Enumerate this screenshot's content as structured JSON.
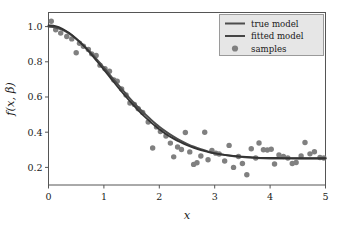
{
  "chart_data": {
    "type": "line",
    "title": "",
    "xlabel": "x",
    "ylabel": "f(x, β)",
    "xlim": [
      0,
      5
    ],
    "ylim": [
      0.1,
      1.08
    ],
    "xticks": [
      0,
      1,
      2,
      3,
      4,
      5
    ],
    "xticklabels": [
      "0",
      "1",
      "2",
      "3",
      "4",
      "5"
    ],
    "yticks": [
      0.2,
      0.4,
      0.6,
      0.8,
      1.0
    ],
    "yticklabels": [
      "0.2",
      "0.4",
      "0.6",
      "0.8",
      "1.0"
    ],
    "grid": false,
    "legend_position": "upper right",
    "legend": [
      {
        "label": "true model",
        "type": "line",
        "color": "#4d4d4d"
      },
      {
        "label": "fitted model",
        "type": "line",
        "color": "#333333"
      },
      {
        "label": "samples",
        "type": "marker",
        "color": "#808080"
      }
    ],
    "series": [
      {
        "name": "true model",
        "type": "line",
        "color": "#4d4d4d",
        "linewidth": 2.0,
        "model": "0.75*exp(-(x/1.60)^2) + 0.25",
        "x": [
          0.0,
          0.125,
          0.25,
          0.375,
          0.5,
          0.625,
          0.75,
          0.875,
          1.0,
          1.125,
          1.25,
          1.375,
          1.5,
          1.625,
          1.75,
          1.875,
          2.0,
          2.125,
          2.25,
          2.375,
          2.5,
          2.625,
          2.75,
          2.875,
          3.0,
          3.25,
          3.5,
          3.75,
          4.0,
          4.25,
          4.5,
          4.75,
          5.0
        ],
        "y": [
          1.0,
          0.995,
          0.982,
          0.96,
          0.931,
          0.896,
          0.856,
          0.812,
          0.766,
          0.719,
          0.672,
          0.626,
          0.581,
          0.539,
          0.5,
          0.464,
          0.431,
          0.402,
          0.376,
          0.353,
          0.334,
          0.317,
          0.303,
          0.291,
          0.281,
          0.268,
          0.259,
          0.254,
          0.251,
          0.25,
          0.25,
          0.25,
          0.25
        ]
      },
      {
        "name": "fitted model",
        "type": "line",
        "color": "#333333",
        "linewidth": 1.8,
        "model": "0.755*exp(-(x/1.545)^2) + 0.252",
        "x": [
          0.0,
          0.125,
          0.25,
          0.375,
          0.5,
          0.625,
          0.75,
          0.875,
          1.0,
          1.125,
          1.25,
          1.375,
          1.5,
          1.625,
          1.75,
          1.875,
          2.0,
          2.125,
          2.25,
          2.375,
          2.5,
          2.625,
          2.75,
          2.875,
          3.0,
          3.25,
          3.5,
          3.75,
          4.0,
          4.25,
          4.5,
          4.75,
          5.0
        ],
        "y": [
          1.007,
          1.002,
          0.987,
          0.963,
          0.931,
          0.893,
          0.85,
          0.803,
          0.755,
          0.706,
          0.657,
          0.61,
          0.565,
          0.523,
          0.484,
          0.449,
          0.417,
          0.389,
          0.365,
          0.344,
          0.326,
          0.311,
          0.298,
          0.288,
          0.28,
          0.268,
          0.261,
          0.256,
          0.254,
          0.253,
          0.252,
          0.252,
          0.252
        ]
      },
      {
        "name": "samples",
        "type": "scatter",
        "color": "#808080",
        "markersize": 4.2,
        "points": [
          [
            0.05,
            1.03
          ],
          [
            0.13,
            0.982
          ],
          [
            0.22,
            0.963
          ],
          [
            0.33,
            0.944
          ],
          [
            0.42,
            0.93
          ],
          [
            0.5,
            0.851
          ],
          [
            0.56,
            0.905
          ],
          [
            0.63,
            0.888
          ],
          [
            0.72,
            0.87
          ],
          [
            0.78,
            0.845
          ],
          [
            0.86,
            0.836
          ],
          [
            0.93,
            0.781
          ],
          [
            1.02,
            0.76
          ],
          [
            1.1,
            0.746
          ],
          [
            1.18,
            0.697
          ],
          [
            1.24,
            0.69
          ],
          [
            1.32,
            0.646
          ],
          [
            1.4,
            0.612
          ],
          [
            1.47,
            0.566
          ],
          [
            1.55,
            0.558
          ],
          [
            1.62,
            0.533
          ],
          [
            1.7,
            0.512
          ],
          [
            1.8,
            0.458
          ],
          [
            1.88,
            0.31
          ],
          [
            1.95,
            0.43
          ],
          [
            2.02,
            0.404
          ],
          [
            2.12,
            0.378
          ],
          [
            2.2,
            0.338
          ],
          [
            2.26,
            0.26
          ],
          [
            2.33,
            0.316
          ],
          [
            2.4,
            0.302
          ],
          [
            2.47,
            0.398
          ],
          [
            2.55,
            0.288
          ],
          [
            2.62,
            0.217
          ],
          [
            2.68,
            0.226
          ],
          [
            2.75,
            0.265
          ],
          [
            2.82,
            0.4
          ],
          [
            2.88,
            0.243
          ],
          [
            2.95,
            0.296
          ],
          [
            3.02,
            0.281
          ],
          [
            3.08,
            0.276
          ],
          [
            3.18,
            0.236
          ],
          [
            3.26,
            0.325
          ],
          [
            3.34,
            0.2
          ],
          [
            3.43,
            0.262
          ],
          [
            3.5,
            0.222
          ],
          [
            3.58,
            0.158
          ],
          [
            3.66,
            0.306
          ],
          [
            3.74,
            0.253
          ],
          [
            3.8,
            0.339
          ],
          [
            3.88,
            0.3
          ],
          [
            3.95,
            0.299
          ],
          [
            4.02,
            0.303
          ],
          [
            4.08,
            0.219
          ],
          [
            4.16,
            0.27
          ],
          [
            4.24,
            0.262
          ],
          [
            4.32,
            0.253
          ],
          [
            4.4,
            0.222
          ],
          [
            4.47,
            0.228
          ],
          [
            4.56,
            0.265
          ],
          [
            4.63,
            0.341
          ],
          [
            4.72,
            0.277
          ],
          [
            4.8,
            0.289
          ],
          [
            4.9,
            0.256
          ],
          [
            4.97,
            0.253
          ]
        ]
      }
    ]
  },
  "axes": {
    "spine_color": "#555555",
    "background": "#ffffff"
  },
  "legend_box": {
    "facecolor": "#e6e6e6",
    "edgecolor": "#9a9a9a"
  }
}
